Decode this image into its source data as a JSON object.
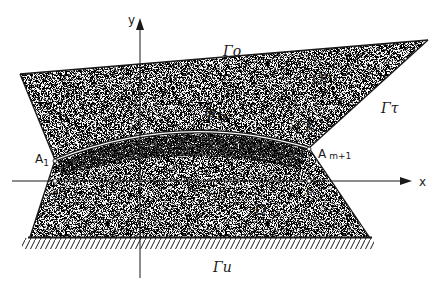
{
  "figure": {
    "type": "domain diagram",
    "axes": {
      "x_label": "x",
      "y_label": "y"
    },
    "boundaries": {
      "top": "Γo",
      "right": "Γτ",
      "interface": "ΓK",
      "bottom": "Γu"
    },
    "regions": {
      "upper": "Ω''",
      "lower": "Ω'"
    },
    "curve_label": "Ψ(x)",
    "curve_label_main": "Ψ",
    "curve_label_arg": "(x)",
    "points": {
      "left_end": "A",
      "left_end_sub": "1",
      "right_end": "A",
      "right_end_sub": "m+1"
    },
    "axis_marks": {
      "a": "a",
      "x": "x",
      "b": "b"
    },
    "colors": {
      "ink": "#1a1a1a",
      "stipple": "#7a7a7a",
      "background": "#ffffff"
    }
  }
}
